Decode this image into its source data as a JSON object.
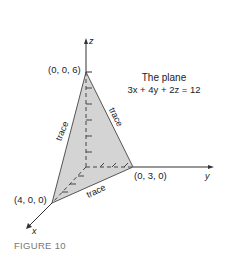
{
  "figure": {
    "caption": "FIGURE 10",
    "title_line1": "The plane",
    "title_line2": "3x + 4y + 2z = 12",
    "axes": {
      "x": "x",
      "y": "y",
      "z": "z"
    },
    "points": {
      "z_intercept": "(0, 0, 6)",
      "y_intercept": "(0, 3, 0)",
      "x_intercept": "(4, 0, 0)"
    },
    "traces": [
      "trace",
      "trace",
      "trace"
    ],
    "colors": {
      "plane_fill": "#d4d4d4",
      "line": "#333333",
      "caption": "#777777"
    }
  }
}
